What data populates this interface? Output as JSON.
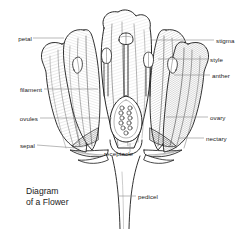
{
  "figure": {
    "title_line1": "Diagram",
    "title_line2": "of a Flower",
    "background_color": "#ffffff",
    "ink_color": "#1a1a1a",
    "leader_color": "#8a8a8a"
  },
  "labels": {
    "petal": "petal",
    "filament": "filament",
    "ovules": "ovules",
    "sepal": "sepal",
    "stigma": "stigma",
    "style": "style",
    "anther": "anther",
    "ovary": "ovary",
    "nectary": "nectary",
    "receptacle": "receptacle",
    "pedicel": "pedicel"
  }
}
